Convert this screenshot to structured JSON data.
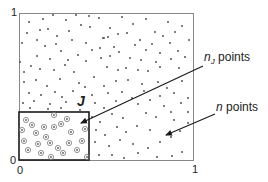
{
  "diagram": {
    "axes": {
      "y_top_label": "1",
      "y_bottom_label": "0",
      "x_left_label": "0",
      "x_right_label": "1"
    },
    "subregion_label": "J",
    "annotations": [
      {
        "id": "nj",
        "var": "n",
        "subscript": "J",
        "text": "points"
      },
      {
        "id": "n",
        "var": "n",
        "text": "points"
      }
    ],
    "colors": {
      "frame": "#888888",
      "subregion_frame": "#1a1a1a",
      "point": "#555555",
      "arrow": "#1a1a1a",
      "circle": "#777777"
    }
  }
}
